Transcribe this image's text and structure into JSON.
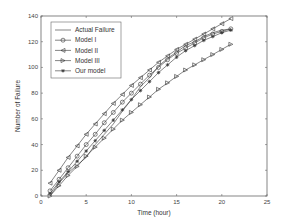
{
  "chart_data": {
    "type": "line",
    "title": "",
    "xlabel": "Time (hour)",
    "ylabel": "Number of Failure",
    "xlim": [
      0,
      25
    ],
    "ylim": [
      0,
      140
    ],
    "xticks": [
      0,
      5,
      10,
      15,
      20,
      25
    ],
    "yticks": [
      0,
      20,
      40,
      60,
      80,
      100,
      120,
      140
    ],
    "grid": false,
    "legend_position": "upper-left",
    "x": [
      1,
      2,
      3,
      4,
      5,
      6,
      7,
      8,
      9,
      10,
      11,
      12,
      13,
      14,
      15,
      16,
      17,
      18,
      19,
      20,
      21
    ],
    "series": [
      {
        "name": "Actual Failure",
        "marker": "none",
        "values": [
          0,
          10,
          18,
          24,
          30,
          40,
          48,
          56,
          66,
          75,
          85,
          92,
          101,
          107,
          112,
          117,
          120,
          124,
          127,
          129,
          130
        ]
      },
      {
        "name": "Model I",
        "marker": "circle",
        "values": [
          4,
          13,
          22,
          31,
          40,
          48,
          57,
          65,
          73,
          80,
          87,
          94,
          100,
          106,
          111,
          115,
          119,
          123,
          126,
          128,
          130
        ]
      },
      {
        "name": "Model II",
        "marker": "triangle-left",
        "values": [
          10,
          20,
          30,
          39,
          48,
          56,
          64,
          72,
          79,
          86,
          92,
          98,
          104,
          109,
          114,
          118,
          122,
          126,
          130,
          134,
          138
        ]
      },
      {
        "name": "Model III",
        "marker": "triangle-right",
        "values": [
          0,
          8,
          16,
          23,
          31,
          38,
          45,
          52,
          59,
          65,
          71,
          77,
          83,
          88,
          93,
          98,
          102,
          106,
          110,
          114,
          118
        ]
      },
      {
        "name": "Our model",
        "marker": "star",
        "values": [
          2,
          11,
          19,
          27,
          35,
          43,
          51,
          59,
          67,
          75,
          82,
          89,
          96,
          102,
          108,
          113,
          117,
          121,
          124,
          127,
          129
        ]
      }
    ]
  },
  "legend": {
    "items": [
      {
        "label": "Actual Failure"
      },
      {
        "label": "Model I"
      },
      {
        "label": "Model II"
      },
      {
        "label": "Model III"
      },
      {
        "label": "Our model"
      }
    ]
  },
  "colors": {
    "line": "#333333",
    "axis": "#666666",
    "background": "#ffffff"
  }
}
